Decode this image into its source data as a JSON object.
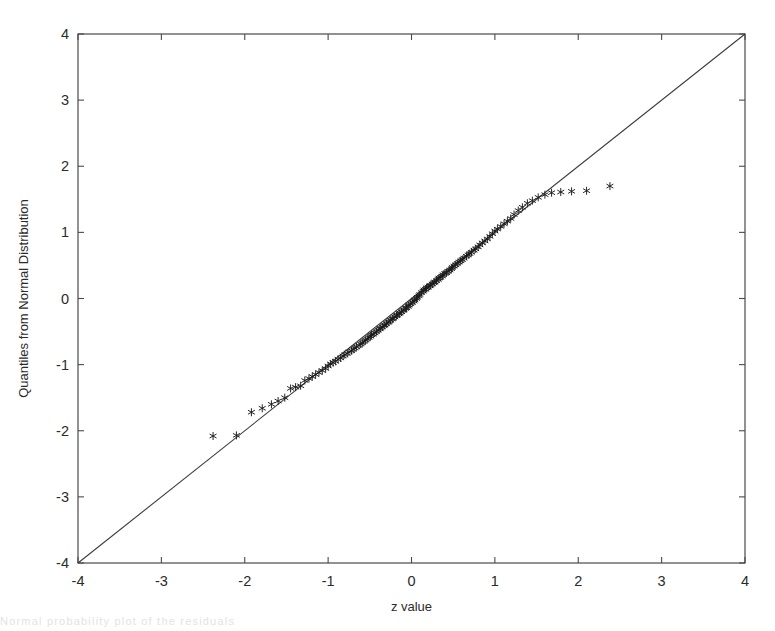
{
  "figure": {
    "caption_fragment": "Normal probability plot of the residuals"
  },
  "chart_data": {
    "type": "scatter",
    "title": "",
    "xlabel": "z value",
    "ylabel": "Quantiles from Normal Distribution",
    "xlim": [
      -4,
      4
    ],
    "ylim": [
      -4,
      4
    ],
    "xticks": [
      -4,
      -3,
      -2,
      -1,
      0,
      1,
      2,
      3,
      4
    ],
    "yticks": [
      -4,
      -3,
      -2,
      -1,
      0,
      1,
      2,
      3,
      4
    ],
    "xticklabels": [
      "-4",
      "-3",
      "-2",
      "-1",
      "0",
      "1",
      "2",
      "3",
      "4"
    ],
    "yticklabels": [
      "-4",
      "-3",
      "-2",
      "-1",
      "0",
      "1",
      "2",
      "3",
      "4"
    ],
    "grid": false,
    "legend": null,
    "marker": "star",
    "marker_color": "#1a1a1a",
    "reference_line": {
      "label": "identity line y = x",
      "x": [
        -4,
        4
      ],
      "y": [
        -4,
        4
      ],
      "color": "#3c3c3c"
    },
    "series": [
      {
        "name": "sample quantiles",
        "x": [
          -2.38,
          -2.1,
          -1.92,
          -1.79,
          -1.68,
          -1.6,
          -1.52,
          -1.45,
          -1.39,
          -1.33,
          -1.28,
          -1.23,
          -1.19,
          -1.15,
          -1.11,
          -1.07,
          -1.03,
          -1.0,
          -0.97,
          -0.94,
          -0.91,
          -0.88,
          -0.85,
          -0.82,
          -0.8,
          -0.77,
          -0.75,
          -0.72,
          -0.7,
          -0.68,
          -0.66,
          -0.63,
          -0.61,
          -0.59,
          -0.57,
          -0.55,
          -0.53,
          -0.51,
          -0.49,
          -0.48,
          -0.46,
          -0.44,
          -0.42,
          -0.4,
          -0.38,
          -0.37,
          -0.35,
          -0.33,
          -0.32,
          -0.3,
          -0.28,
          -0.27,
          -0.25,
          -0.23,
          -0.22,
          -0.2,
          -0.18,
          -0.17,
          -0.15,
          -0.14,
          -0.12,
          -0.1,
          -0.09,
          -0.07,
          -0.06,
          -0.04,
          -0.03,
          -0.01,
          0.01,
          0.03,
          0.04,
          0.06,
          0.07,
          0.09,
          0.1,
          0.12,
          0.14,
          0.15,
          0.17,
          0.18,
          0.2,
          0.22,
          0.23,
          0.25,
          0.27,
          0.28,
          0.3,
          0.32,
          0.33,
          0.35,
          0.37,
          0.38,
          0.4,
          0.42,
          0.44,
          0.46,
          0.48,
          0.49,
          0.51,
          0.53,
          0.55,
          0.57,
          0.59,
          0.61,
          0.63,
          0.66,
          0.68,
          0.7,
          0.72,
          0.75,
          0.77,
          0.8,
          0.82,
          0.85,
          0.88,
          0.91,
          0.94,
          0.97,
          1.0,
          1.03,
          1.07,
          1.11,
          1.15,
          1.19,
          1.23,
          1.28,
          1.33,
          1.39,
          1.45,
          1.52,
          1.6,
          1.68,
          1.79,
          1.92,
          2.1,
          2.38
        ],
        "y": [
          -2.08,
          -2.07,
          -1.72,
          -1.66,
          -1.6,
          -1.55,
          -1.5,
          -1.36,
          -1.34,
          -1.32,
          -1.24,
          -1.21,
          -1.18,
          -1.15,
          -1.12,
          -1.09,
          -1.06,
          -1.02,
          -0.99,
          -0.97,
          -0.95,
          -0.92,
          -0.9,
          -0.87,
          -0.85,
          -0.83,
          -0.81,
          -0.79,
          -0.77,
          -0.75,
          -0.73,
          -0.71,
          -0.69,
          -0.67,
          -0.65,
          -0.63,
          -0.61,
          -0.59,
          -0.57,
          -0.55,
          -0.54,
          -0.52,
          -0.5,
          -0.48,
          -0.46,
          -0.45,
          -0.43,
          -0.41,
          -0.4,
          -0.38,
          -0.36,
          -0.35,
          -0.33,
          -0.31,
          -0.3,
          -0.28,
          -0.26,
          -0.25,
          -0.23,
          -0.22,
          -0.2,
          -0.18,
          -0.17,
          -0.15,
          -0.14,
          -0.12,
          -0.1,
          -0.08,
          -0.06,
          -0.04,
          -0.02,
          0.0,
          0.02,
          0.04,
          0.06,
          0.09,
          0.11,
          0.13,
          0.14,
          0.16,
          0.17,
          0.19,
          0.2,
          0.22,
          0.24,
          0.25,
          0.27,
          0.29,
          0.31,
          0.32,
          0.34,
          0.36,
          0.38,
          0.39,
          0.41,
          0.43,
          0.45,
          0.47,
          0.49,
          0.51,
          0.53,
          0.55,
          0.57,
          0.59,
          0.61,
          0.64,
          0.66,
          0.68,
          0.7,
          0.73,
          0.75,
          0.78,
          0.81,
          0.84,
          0.87,
          0.9,
          0.94,
          0.98,
          1.02,
          1.05,
          1.09,
          1.13,
          1.17,
          1.21,
          1.27,
          1.33,
          1.38,
          1.44,
          1.48,
          1.53,
          1.57,
          1.6,
          1.61,
          1.62,
          1.63,
          1.7
        ]
      }
    ]
  }
}
